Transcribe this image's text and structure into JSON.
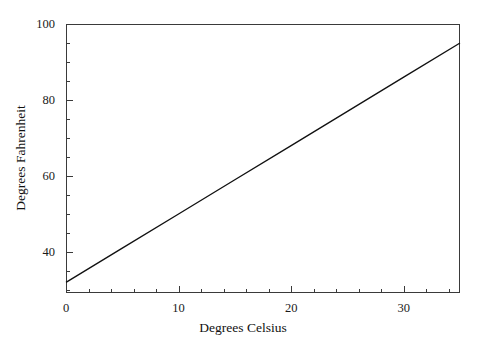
{
  "chart_data": {
    "type": "line",
    "title": "",
    "subtitle": "",
    "xlabel": "Degrees Celsius",
    "ylabel": "Degrees Fahrenheit",
    "xlim": [
      0,
      35
    ],
    "ylim": [
      29.2,
      100
    ],
    "grid": false,
    "legend": null,
    "x_ticks_major": [
      0,
      10,
      20,
      30
    ],
    "x_tick_labels": [
      "0",
      "10",
      "20",
      "30"
    ],
    "x_tick_minor_step": 2,
    "y_ticks_major": [
      40,
      60,
      80,
      100
    ],
    "y_tick_labels": [
      "40",
      "60",
      "80",
      "100"
    ],
    "y_tick_minor_step": 5,
    "series": [
      {
        "name": "Celsius to Fahrenheit",
        "relation": "F = 1.8 * C + 32",
        "color": "#111111",
        "x": [
          0,
          5,
          10,
          15,
          20,
          25,
          30,
          35
        ],
        "values": [
          32,
          41,
          50,
          59,
          68,
          77,
          86,
          95
        ]
      }
    ],
    "annotations": []
  },
  "figure": {
    "background_color": "#ffffff",
    "axis_color": "#3a3a3a",
    "line_color": "#111111"
  }
}
